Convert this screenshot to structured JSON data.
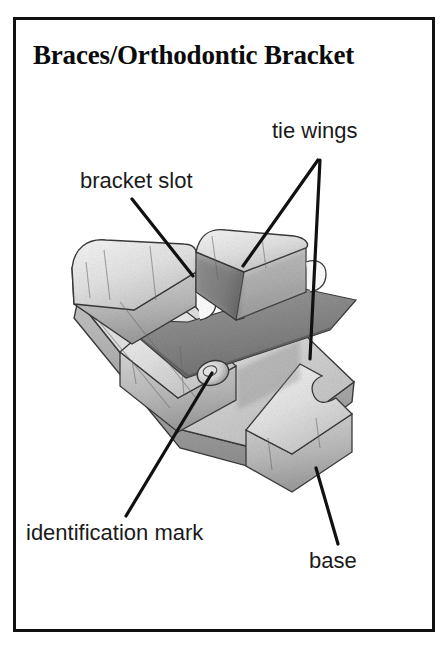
{
  "figure": {
    "title": "Braces/Orthodontic Bracket",
    "frame_color": "#111111",
    "background_color": "#ffffff",
    "illustration": {
      "subject": "orthodontic-bracket",
      "style": "grayscale pencil shaded line drawing, three-quarter perspective view",
      "ink_color": "#1a1a1a",
      "shading_colors": [
        "#ffffff",
        "#f2f2f2",
        "#e0e0e0",
        "#cfcfcf",
        "#b5b5b5",
        "#9a9a9a",
        "#7d7d7d",
        "#5e5e5e"
      ]
    },
    "labels": [
      {
        "id": "tie-wings",
        "text": "tie wings"
      },
      {
        "id": "bracket-slot",
        "text": "bracket slot"
      },
      {
        "id": "identification-mark",
        "text": "identification mark"
      },
      {
        "id": "base",
        "text": "base"
      }
    ],
    "leader_lines": [
      {
        "id": "tie-wings-leader-left",
        "from": [
          318,
          160
        ],
        "to": [
          243,
          266
        ]
      },
      {
        "id": "tie-wings-leader-right",
        "from": [
          320,
          160
        ],
        "to": [
          310,
          359
        ]
      },
      {
        "id": "bracket-slot-leader",
        "from": [
          132,
          199
        ],
        "to": [
          193,
          276
        ]
      },
      {
        "id": "identification-leader",
        "from": [
          212,
          373
        ],
        "to": [
          126,
          516
        ]
      },
      {
        "id": "base-leader",
        "from": [
          316,
          468
        ],
        "to": [
          338,
          544
        ]
      }
    ]
  }
}
